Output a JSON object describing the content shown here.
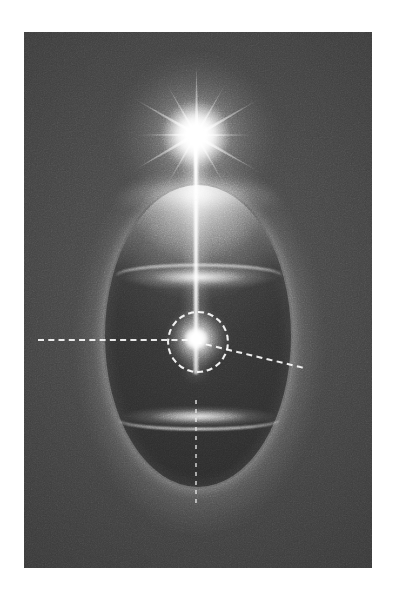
{
  "figure": {
    "kind": "optical-diagram-photograph",
    "title": "Point light source above a translucent ellipsoid with inner focal sphere",
    "background_color": "#ffffff",
    "plate_color": "#3b3b3b",
    "highlight_color": "#ffffff",
    "plate": {
      "x": 24,
      "y": 32,
      "width": 348,
      "height": 536
    }
  },
  "elements": {
    "light_source": {
      "label": "starburst light source",
      "center_x": 196,
      "center_y": 135,
      "ray_count": 12,
      "color": "#ffffff"
    },
    "beam": {
      "label": "axial light beam",
      "from_y": 142,
      "to_y": 342,
      "x": 196,
      "color": "#ffffff"
    },
    "ellipsoid": {
      "label": "translucent ellipsoid body",
      "center_x": 197,
      "center_y": 336,
      "semi_width": 93,
      "semi_height": 151,
      "fill_color": "#343434"
    },
    "upper_band": {
      "label": "upper caustic band",
      "y": 242,
      "color": "#ffffff"
    },
    "lower_band": {
      "label": "lower caustic band",
      "y": 412,
      "color": "#ffffff"
    },
    "inner_sphere": {
      "label": "inner focal sphere",
      "center_x": 196,
      "center_y": 340,
      "radius": 13,
      "color": "#ffffff"
    },
    "dashed_circle": {
      "label": "dashed construction circle",
      "center_x": 196,
      "center_y": 340,
      "radius": 29,
      "stroke": "#ffffff",
      "style": "dashed"
    },
    "horizontal_axis": {
      "label": "horizontal dashed axis",
      "from_x": 38,
      "to_x": 196,
      "y": 341,
      "stroke": "#ffffff",
      "style": "dashed"
    },
    "diagonal_ray": {
      "label": "diagonal dashed ray",
      "from_x": 196,
      "from_y": 341,
      "to_x": 278,
      "to_y": 366,
      "angle_degrees": 13.5,
      "stroke": "#ffffff",
      "style": "dashed"
    },
    "lower_axis": {
      "label": "dotted lower axis",
      "x": 196,
      "from_y": 400,
      "to_y": 506,
      "stroke": "#ffffff",
      "style": "dotted"
    }
  },
  "rays": [
    {
      "angle": 0
    },
    {
      "angle": 30
    },
    {
      "angle": 60
    },
    {
      "angle": 90
    },
    {
      "angle": 120
    },
    {
      "angle": 150
    },
    {
      "angle": 180
    },
    {
      "angle": 210
    },
    {
      "angle": 240
    },
    {
      "angle": 270
    },
    {
      "angle": 300
    },
    {
      "angle": 330
    }
  ]
}
